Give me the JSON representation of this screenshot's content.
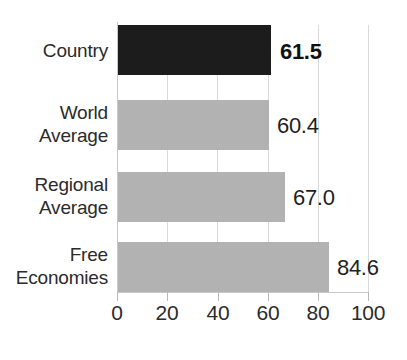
{
  "chart_data": {
    "type": "bar",
    "orientation": "horizontal",
    "title": "",
    "xlabel": "",
    "ylabel": "",
    "categories": [
      "Country",
      "World Average",
      "Regional Average",
      "Free Economies"
    ],
    "values": [
      61.5,
      60.4,
      67.0,
      84.6
    ],
    "value_labels": [
      "61.5",
      "60.4",
      "67.0",
      "84.6"
    ],
    "xlim": [
      0,
      100
    ],
    "xticks": [
      0,
      20,
      40,
      60,
      80,
      100
    ],
    "xtick_labels": [
      "0",
      "20",
      "40",
      "60",
      "80",
      "100"
    ],
    "grid": true,
    "grid_axis": "x",
    "legend": "none",
    "bar_colors": [
      "#1c1c1c",
      "#b2b2b2",
      "#b2b2b2",
      "#b2b2b2"
    ],
    "highlight_index": 0,
    "series": [
      {
        "name": "Score",
        "values": [
          61.5,
          60.4,
          67.0,
          84.6
        ]
      }
    ]
  },
  "category_lines": [
    [
      "Country"
    ],
    [
      "World",
      "Average"
    ],
    [
      "Regional",
      "Average"
    ],
    [
      "Free",
      "Economies"
    ]
  ],
  "colors": {
    "highlight_bar": "#1c1c1c",
    "bar": "#b2b2b2",
    "gridline": "#d9d9d9",
    "axis": "#c9c9c9",
    "text": "#2b2b2b"
  },
  "title_remnant": ""
}
